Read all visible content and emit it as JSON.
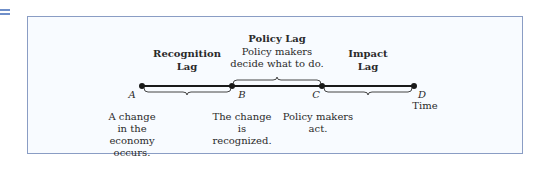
{
  "diagram": {
    "title": "Policy Lag",
    "lags": [
      {
        "label_line1": "Recognition",
        "label_line2": "Lag"
      },
      {
        "label_line1": "Policy Lag",
        "desc_line1": "Policy makers",
        "desc_line2": "decide what to do."
      },
      {
        "label_line1": "Impact",
        "label_line2": "Lag"
      }
    ],
    "points": [
      {
        "letter": "A",
        "desc": [
          "A change",
          "in the",
          "economy",
          "occurs."
        ]
      },
      {
        "letter": "B",
        "desc": [
          "The change",
          "is",
          "recognized."
        ]
      },
      {
        "letter": "C",
        "desc": [
          "Policy makers",
          "act."
        ]
      },
      {
        "letter": "D",
        "desc": [
          "Time"
        ]
      }
    ],
    "colors": {
      "border": "#8a9dc4",
      "accent": "#6f8fc9",
      "line": "#1a1a1a"
    }
  }
}
